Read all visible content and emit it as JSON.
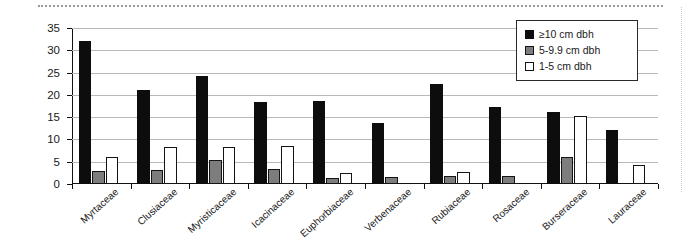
{
  "chart_data": {
    "type": "bar",
    "title": "",
    "xlabel": "",
    "ylabel": "Number of individuals",
    "ylim": [
      0,
      35
    ],
    "yticks": [
      0,
      5,
      10,
      15,
      20,
      25,
      30,
      35
    ],
    "grid": "horizontal",
    "legend_position": "top-right",
    "categories": [
      "Myrtaceae",
      "Clusiaceae",
      "Myristicaceae",
      "Icacinaceae",
      "Euphorbiaceae",
      "Verbenaceae",
      "Rubiaceae",
      "Rosaceae",
      "Burseraceae",
      "Lauraceae"
    ],
    "series": [
      {
        "name": "≥10 cm dbh",
        "color": "#0d0d0d",
        "values": [
          32,
          21,
          24.3,
          18.5,
          18.7,
          13.8,
          22.5,
          17.2,
          16.2,
          12.2
        ]
      },
      {
        "name": "5-9.9 cm dbh",
        "color": "#7d7d7d",
        "values": [
          3,
          3.2,
          5.3,
          3.4,
          1.4,
          1.6,
          1.8,
          1.9,
          6.1,
          0
        ]
      },
      {
        "name": "1-5 cm dbh",
        "color": "#ffffff",
        "values": [
          6,
          8.2,
          8.4,
          8.6,
          2.5,
          0,
          2.8,
          0,
          15.2,
          4.2
        ]
      }
    ]
  },
  "legend": {
    "items": [
      {
        "label": "≥10 cm dbh"
      },
      {
        "label": "5-9.9 cm dbh"
      },
      {
        "label": "1-5 cm dbh"
      }
    ]
  },
  "axes": {
    "y_title": "Number of individuals"
  }
}
